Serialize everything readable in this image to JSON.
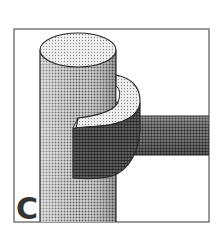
{
  "figure": {
    "panel_label": "C",
    "colors": {
      "frame": "#555555",
      "outline": "#2a2a2a",
      "label": "#333333",
      "light_dots": "#9a9a9a",
      "mid_dots": "#6a6a6a",
      "dark_dots": "#3a3a3a"
    }
  }
}
